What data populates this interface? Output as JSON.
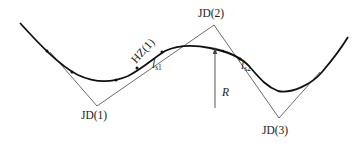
{
  "diagram": {
    "type": "road-alignment-curve",
    "intersection_points": [
      {
        "label": "JD(1)"
      },
      {
        "label": "JD(2)"
      },
      {
        "label": "JD(3)"
      }
    ],
    "point_labels": {
      "hz": "HZ(1)"
    },
    "spiral_labels": [
      {
        "base": "l",
        "sub": "s1"
      },
      {
        "base": "l",
        "sub": "s2"
      }
    ],
    "radius_label": "R",
    "colors": {
      "curve": "#111111",
      "tangent": "#555555",
      "text": "#1a1a1a"
    }
  }
}
